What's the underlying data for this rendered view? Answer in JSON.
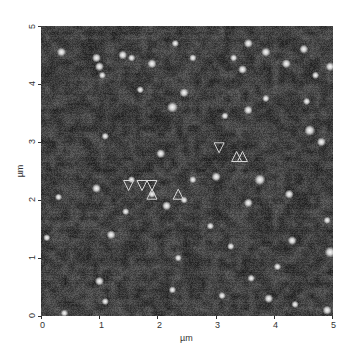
{
  "chart_data": {
    "type": "heatmap",
    "title": "",
    "xlabel": "µm",
    "ylabel": "µm",
    "xlim": [
      0,
      5
    ],
    "ylim": [
      0,
      5
    ],
    "xticks": [
      "0",
      "1",
      "2",
      "3",
      "4",
      "5"
    ],
    "yticks": [
      "0",
      "1",
      "2",
      "3",
      "4",
      "5"
    ],
    "colormap": "grayscale",
    "background_gray": "#3a3a3a",
    "particles": [
      {
        "x": 0.35,
        "y": 4.55,
        "r": 0.05
      },
      {
        "x": 0.95,
        "y": 4.45,
        "r": 0.05
      },
      {
        "x": 1.0,
        "y": 4.3,
        "r": 0.05
      },
      {
        "x": 1.05,
        "y": 4.15,
        "r": 0.04
      },
      {
        "x": 1.4,
        "y": 4.5,
        "r": 0.05
      },
      {
        "x": 1.55,
        "y": 4.45,
        "r": 0.04
      },
      {
        "x": 1.9,
        "y": 4.35,
        "r": 0.05
      },
      {
        "x": 2.3,
        "y": 4.7,
        "r": 0.04
      },
      {
        "x": 2.6,
        "y": 4.45,
        "r": 0.04
      },
      {
        "x": 2.45,
        "y": 3.85,
        "r": 0.05
      },
      {
        "x": 2.25,
        "y": 3.6,
        "r": 0.06
      },
      {
        "x": 3.3,
        "y": 4.45,
        "r": 0.04
      },
      {
        "x": 3.55,
        "y": 4.7,
        "r": 0.05
      },
      {
        "x": 3.85,
        "y": 4.55,
        "r": 0.05
      },
      {
        "x": 3.45,
        "y": 4.25,
        "r": 0.05
      },
      {
        "x": 4.2,
        "y": 4.35,
        "r": 0.05
      },
      {
        "x": 4.5,
        "y": 4.6,
        "r": 0.05
      },
      {
        "x": 4.7,
        "y": 4.15,
        "r": 0.04
      },
      {
        "x": 4.95,
        "y": 4.3,
        "r": 0.05
      },
      {
        "x": 3.55,
        "y": 3.55,
        "r": 0.05
      },
      {
        "x": 3.85,
        "y": 3.75,
        "r": 0.04
      },
      {
        "x": 4.6,
        "y": 3.2,
        "r": 0.06
      },
      {
        "x": 4.8,
        "y": 3.0,
        "r": 0.05
      },
      {
        "x": 3.15,
        "y": 3.45,
        "r": 0.04
      },
      {
        "x": 1.1,
        "y": 3.1,
        "r": 0.04
      },
      {
        "x": 2.05,
        "y": 2.8,
        "r": 0.05
      },
      {
        "x": 2.6,
        "y": 2.35,
        "r": 0.04
      },
      {
        "x": 3.0,
        "y": 2.4,
        "r": 0.05
      },
      {
        "x": 3.75,
        "y": 2.35,
        "r": 0.06
      },
      {
        "x": 3.55,
        "y": 1.95,
        "r": 0.05
      },
      {
        "x": 4.25,
        "y": 2.1,
        "r": 0.05
      },
      {
        "x": 1.55,
        "y": 2.35,
        "r": 0.04
      },
      {
        "x": 0.95,
        "y": 2.2,
        "r": 0.05
      },
      {
        "x": 0.3,
        "y": 2.05,
        "r": 0.04
      },
      {
        "x": 1.9,
        "y": 2.1,
        "r": 0.04
      },
      {
        "x": 2.15,
        "y": 1.9,
        "r": 0.05
      },
      {
        "x": 2.45,
        "y": 2.0,
        "r": 0.04
      },
      {
        "x": 2.9,
        "y": 1.55,
        "r": 0.04
      },
      {
        "x": 4.9,
        "y": 1.65,
        "r": 0.04
      },
      {
        "x": 4.3,
        "y": 1.3,
        "r": 0.05
      },
      {
        "x": 4.95,
        "y": 1.1,
        "r": 0.06
      },
      {
        "x": 2.35,
        "y": 1.0,
        "r": 0.04
      },
      {
        "x": 1.2,
        "y": 1.4,
        "r": 0.05
      },
      {
        "x": 0.1,
        "y": 1.35,
        "r": 0.04
      },
      {
        "x": 1.0,
        "y": 0.6,
        "r": 0.05
      },
      {
        "x": 1.1,
        "y": 0.25,
        "r": 0.04
      },
      {
        "x": 2.25,
        "y": 0.45,
        "r": 0.04
      },
      {
        "x": 0.4,
        "y": 0.05,
        "r": 0.04
      },
      {
        "x": 3.1,
        "y": 0.35,
        "r": 0.04
      },
      {
        "x": 3.9,
        "y": 0.3,
        "r": 0.05
      },
      {
        "x": 4.35,
        "y": 0.2,
        "r": 0.04
      },
      {
        "x": 4.9,
        "y": 0.1,
        "r": 0.05
      },
      {
        "x": 3.6,
        "y": 0.65,
        "r": 0.04
      },
      {
        "x": 4.05,
        "y": 0.85,
        "r": 0.04
      },
      {
        "x": 1.7,
        "y": 3.9,
        "r": 0.04
      },
      {
        "x": 4.55,
        "y": 3.7,
        "r": 0.04
      },
      {
        "x": 1.45,
        "y": 1.8,
        "r": 0.04
      },
      {
        "x": 3.25,
        "y": 1.2,
        "r": 0.04
      }
    ],
    "markers": [
      {
        "type": "down-triangle",
        "x": 1.5,
        "y": 2.25
      },
      {
        "type": "down-triangle",
        "x": 1.73,
        "y": 2.25
      },
      {
        "type": "down-triangle",
        "x": 1.9,
        "y": 2.25
      },
      {
        "type": "up-triangle",
        "x": 1.9,
        "y": 2.1
      },
      {
        "type": "up-triangle",
        "x": 2.35,
        "y": 2.1
      },
      {
        "type": "down-triangle",
        "x": 3.05,
        "y": 2.9
      },
      {
        "type": "up-triangle",
        "x": 3.35,
        "y": 2.75
      },
      {
        "type": "up-triangle",
        "x": 3.45,
        "y": 2.75
      }
    ]
  }
}
